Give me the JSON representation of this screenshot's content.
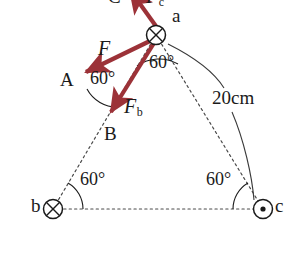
{
  "figure": {
    "canvas": {
      "width": 306,
      "height": 254
    },
    "colors": {
      "vector": "#9c3238",
      "ink": "#1a1a1a",
      "dashed": "#4a4a4a",
      "background": "#ffffff"
    },
    "conductors": [
      {
        "id": "a",
        "label": "a",
        "marker": "cross-circle",
        "meaning": "current into page",
        "x": 156,
        "y": 35,
        "label_x": 172,
        "label_y": 16
      },
      {
        "id": "b",
        "label": "b",
        "marker": "cross-circle",
        "meaning": "current into page",
        "x": 53,
        "y": 209,
        "label_x": 31,
        "label_y": 201
      },
      {
        "id": "c",
        "label": "c",
        "marker": "dot-circle",
        "meaning": "current out of page",
        "x": 263,
        "y": 209,
        "label_x": 276,
        "label_y": 201
      }
    ],
    "vector_points": [
      {
        "id": "A",
        "label": "A",
        "x": 83,
        "y": 74,
        "label_x": 62,
        "label_y": 72
      },
      {
        "id": "B",
        "label": "B",
        "x": 110,
        "y": 116,
        "label_x": 105,
        "label_y": 124
      }
    ],
    "vectors": [
      {
        "name": "F",
        "label": "F",
        "subscript": "",
        "from": "a",
        "to": "A",
        "label_x": 100,
        "label_y": 42
      },
      {
        "name": "F_b",
        "label": "F",
        "subscript": "b",
        "from": "a",
        "to": "B",
        "label_x": 124,
        "label_y": 101
      },
      {
        "name": "F_c",
        "label": "F",
        "subscript": "c",
        "from": "a",
        "to": "C",
        "label_x": 152,
        "label_y": -8,
        "clipped": true
      }
    ],
    "clipped_labels": [
      {
        "text": "C",
        "x": 112,
        "y": -9
      }
    ],
    "angles": [
      {
        "id": "angle-at-a",
        "value": "60",
        "unit": "°",
        "label_x": 150,
        "label_y": 62,
        "vertex": "a"
      },
      {
        "id": "angle-at-A",
        "value": "60",
        "unit": "°",
        "label_x": 90,
        "label_y": 77,
        "vertex": "A"
      },
      {
        "id": "angle-at-b",
        "value": "60",
        "unit": "°",
        "label_x": 81,
        "label_y": 178,
        "vertex": "b"
      },
      {
        "id": "angle-at-c",
        "value": "60",
        "unit": "°",
        "label_x": 206,
        "label_y": 178,
        "vertex": "c"
      }
    ],
    "dimension": {
      "id": "side-length",
      "text": "20cm",
      "label_x": 212,
      "label_y": 96,
      "describes": "length of triangle side a-c"
    }
  }
}
